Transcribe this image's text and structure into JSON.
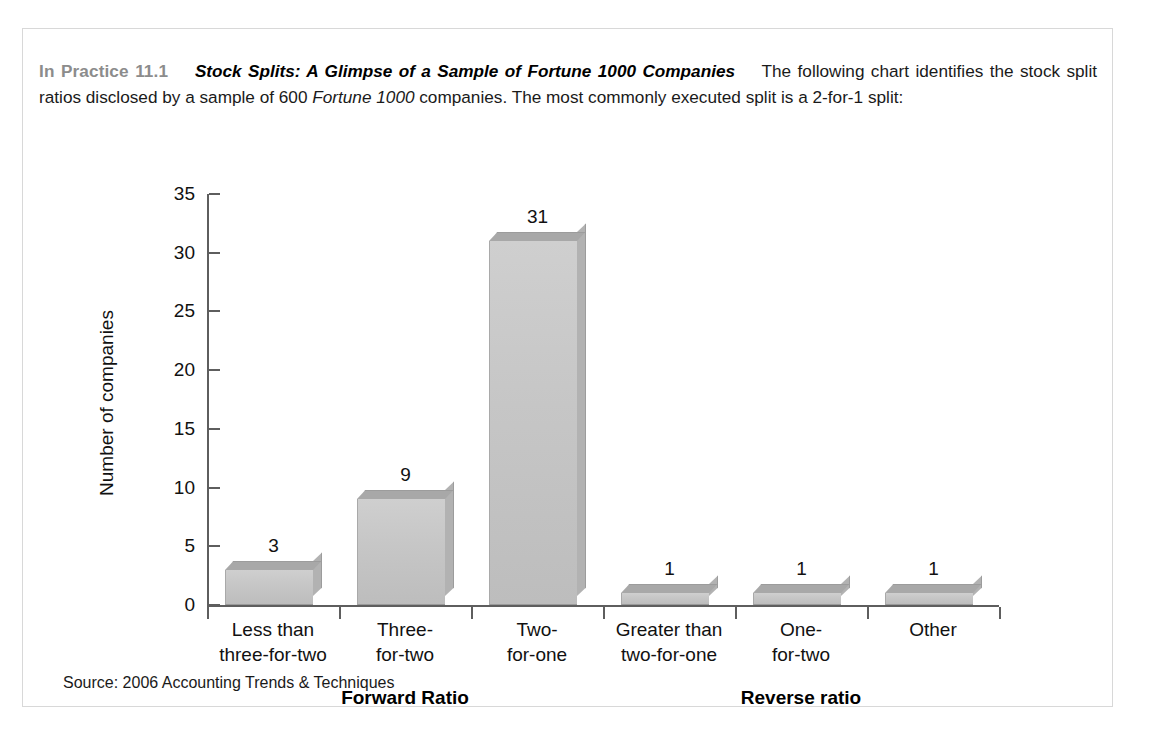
{
  "box": {
    "intro": {
      "label": "In Practice 11.1",
      "title": "Stock Splits: A Glimpse of a Sample of Fortune 1000 Companies",
      "body_part1": "The following chart identifies the stock split ratios disclosed by a sample of 600 ",
      "body_italic": "Fortune 1000",
      "body_part2": " companies. The most commonly executed split is a 2-for-1 split:"
    },
    "source": "Source: 2006 Accounting Trends & Techniques"
  },
  "chart_data": {
    "type": "bar",
    "title": "",
    "xlabel": "",
    "ylabel": "Number of companies",
    "ylim": [
      0,
      35
    ],
    "yticks": [
      0,
      5,
      10,
      15,
      20,
      25,
      30,
      35
    ],
    "ytick_labels": [
      "0",
      "5",
      "10",
      "15",
      "20",
      "25",
      "30",
      "35"
    ],
    "grid": false,
    "legend": "none",
    "categories": [
      "Less than\nthree-for-two",
      "Three-\nfor-two",
      "Two-\nfor-one",
      "Greater than\ntwo-for-one",
      "One-\nfor-two",
      "Other"
    ],
    "category_lines": [
      [
        "Less than",
        "three-for-two"
      ],
      [
        "Three-",
        "for-two"
      ],
      [
        "Two-",
        "for-one"
      ],
      [
        "Greater than",
        "two-for-one"
      ],
      [
        "One-",
        "for-two"
      ],
      [
        "Other",
        ""
      ]
    ],
    "values": [
      3,
      9,
      31,
      1,
      1,
      1
    ],
    "value_labels": [
      "3",
      "9",
      "31",
      "1",
      "1",
      "1"
    ],
    "groups": [
      {
        "label": "Forward Ratio",
        "categories": [
          0,
          1,
          2
        ]
      },
      {
        "label": "Reverse ratio",
        "categories": [
          3,
          4,
          5
        ]
      }
    ],
    "bar_color": "#c6c6c6",
    "bar_top_color": "#a8a8a8",
    "bar_side_color": "#b2b2b2",
    "axis_color": "#5e5e5e"
  }
}
